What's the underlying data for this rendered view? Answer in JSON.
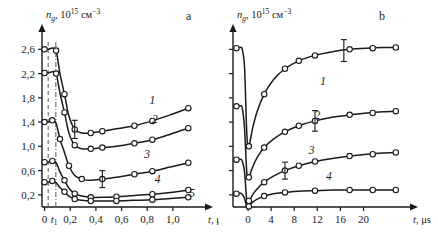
{
  "figure": {
    "background": "#ffffff",
    "ink_color": "#1a1a1a",
    "guide_color": "#555555"
  },
  "chart_data": [
    {
      "type": "line",
      "panel": "a",
      "panel_label": "a",
      "title": "",
      "ylabel": "n_g, 10^15 см^-3",
      "ylabel_symbol": "n",
      "ylabel_subscript": "g",
      "ylabel_rest": ", 10",
      "ylabel_exp1": "15",
      "ylabel_unit": "см",
      "ylabel_exp2": "−3",
      "xlabel": "t, μs",
      "xlabel_symbol": "t",
      "xlabel_unit": ", μs",
      "xticks": [
        0,
        0.2,
        0.4,
        0.6,
        0.8,
        1.0
      ],
      "xticklabels": [
        "0",
        "0,2",
        "0,4",
        "0,6",
        "0,8",
        "1,0"
      ],
      "special_xtick": {
        "label": "t₁",
        "value": 0.075
      },
      "xlim": [
        -0.02,
        1.18
      ],
      "yticks": [
        0.2,
        0.6,
        1.0,
        1.4,
        1.8,
        2.2,
        2.6
      ],
      "yticklabels": [
        "0,2",
        "0,6",
        "1,0",
        "1,4",
        "1,8",
        "2,2",
        "2,6"
      ],
      "ylim": [
        0.0,
        2.82
      ],
      "grid": false,
      "legend": "inline-curve-numbers",
      "guides": [
        {
          "kind": "dashed",
          "x": 0.028
        },
        {
          "kind": "dashdot",
          "x": 0.088
        }
      ],
      "series": [
        {
          "name": "1",
          "label": "1",
          "label_pos": {
            "x": 0.84,
            "y": 1.7
          },
          "x": [
            0.0,
            0.03,
            0.06,
            0.09,
            0.12,
            0.155,
            0.19,
            0.235,
            0.29,
            0.36,
            0.45,
            0.56,
            0.7,
            0.84,
            0.98,
            1.12
          ],
          "y": [
            2.6,
            2.6,
            2.62,
            2.58,
            2.2,
            1.86,
            1.5,
            1.28,
            1.22,
            1.22,
            1.25,
            1.29,
            1.34,
            1.42,
            1.52,
            1.63
          ],
          "markers_x": [
            0.0,
            0.09,
            0.155,
            0.235,
            0.36,
            0.45,
            0.7,
            0.84,
            1.12
          ],
          "markers_y": [
            2.6,
            2.58,
            1.86,
            1.28,
            1.22,
            1.25,
            1.34,
            1.42,
            1.63
          ],
          "errorbars": [
            {
              "x": 0.235,
              "y": 1.28,
              "err": 0.15
            }
          ]
        },
        {
          "name": "2",
          "label": "2",
          "label_pos": {
            "x": 0.86,
            "y": 1.38
          },
          "x": [
            0.0,
            0.03,
            0.06,
            0.09,
            0.12,
            0.155,
            0.19,
            0.235,
            0.29,
            0.36,
            0.45,
            0.56,
            0.7,
            0.84,
            0.98,
            1.12
          ],
          "y": [
            2.21,
            2.21,
            2.23,
            2.2,
            1.88,
            1.56,
            1.22,
            1.02,
            0.96,
            0.96,
            0.98,
            1.0,
            1.05,
            1.11,
            1.2,
            1.3
          ],
          "markers_x": [
            0.0,
            0.09,
            0.155,
            0.235,
            0.36,
            0.45,
            0.7,
            0.84,
            1.12
          ],
          "markers_y": [
            2.21,
            2.2,
            1.56,
            1.02,
            0.96,
            0.98,
            1.05,
            1.11,
            1.3
          ],
          "errorbars": []
        },
        {
          "name": "3",
          "label": "3",
          "label_pos": {
            "x": 0.8,
            "y": 0.8
          },
          "x": [
            0.0,
            0.03,
            0.06,
            0.09,
            0.12,
            0.155,
            0.19,
            0.235,
            0.29,
            0.36,
            0.45,
            0.56,
            0.7,
            0.84,
            0.98,
            1.12
          ],
          "y": [
            1.4,
            1.4,
            1.43,
            1.38,
            1.12,
            0.9,
            0.68,
            0.52,
            0.46,
            0.44,
            0.46,
            0.49,
            0.54,
            0.59,
            0.66,
            0.73
          ],
          "markers_x": [
            0.0,
            0.06,
            0.12,
            0.19,
            0.29,
            0.45,
            0.7,
            0.84,
            1.12
          ],
          "markers_y": [
            1.4,
            1.43,
            1.12,
            0.68,
            0.46,
            0.46,
            0.54,
            0.59,
            0.73
          ],
          "errorbars": [
            {
              "x": 0.45,
              "y": 0.46,
              "err": 0.14
            }
          ]
        },
        {
          "name": "4",
          "label": "4",
          "label_pos": {
            "x": 0.88,
            "y": 0.4
          },
          "x": [
            0.0,
            0.03,
            0.06,
            0.09,
            0.12,
            0.155,
            0.19,
            0.235,
            0.29,
            0.36,
            0.45,
            0.56,
            0.7,
            0.84,
            0.98,
            1.12
          ],
          "y": [
            0.74,
            0.74,
            0.76,
            0.73,
            0.58,
            0.44,
            0.31,
            0.22,
            0.18,
            0.16,
            0.16,
            0.17,
            0.19,
            0.21,
            0.24,
            0.28
          ],
          "markers_x": [
            0.0,
            0.06,
            0.155,
            0.235,
            0.36,
            0.56,
            0.84,
            1.12
          ],
          "markers_y": [
            0.74,
            0.76,
            0.44,
            0.22,
            0.16,
            0.17,
            0.21,
            0.28
          ],
          "errorbars": []
        },
        {
          "name": "5",
          "label": "5",
          "label_pos": {
            "x": 1.15,
            "y": 0.16
          },
          "x": [
            0.0,
            0.03,
            0.06,
            0.09,
            0.12,
            0.155,
            0.19,
            0.235,
            0.29,
            0.36,
            0.45,
            0.56,
            0.7,
            0.84,
            0.98,
            1.12
          ],
          "y": [
            0.41,
            0.41,
            0.43,
            0.4,
            0.32,
            0.25,
            0.18,
            0.13,
            0.11,
            0.1,
            0.1,
            0.1,
            0.11,
            0.12,
            0.14,
            0.16
          ],
          "markers_x": [
            0.0,
            0.06,
            0.155,
            0.235,
            0.36,
            0.56,
            0.84,
            1.12
          ],
          "markers_y": [
            0.41,
            0.43,
            0.25,
            0.13,
            0.1,
            0.1,
            0.12,
            0.16
          ],
          "errorbars": []
        }
      ]
    },
    {
      "type": "line",
      "panel": "b",
      "panel_label": "b",
      "title": "",
      "ylabel": "n_g, 10^15 см^-3",
      "ylabel_symbol": "n",
      "ylabel_subscript": "g",
      "ylabel_rest": ", 10",
      "ylabel_exp1": "15",
      "ylabel_unit": "см",
      "ylabel_exp2": "−3",
      "xlabel": "t, μs",
      "xlabel_symbol": "t",
      "xlabel_unit": ", μs",
      "xticks": [
        0,
        4,
        8,
        12,
        16,
        20
      ],
      "xticklabels": [
        "0",
        "4",
        "8",
        "12",
        "16",
        "20"
      ],
      "xlim": [
        -2.6,
        26.5
      ],
      "yticks_unlabeled": [
        0.2,
        0.6,
        1.0,
        1.4,
        1.8,
        2.2,
        2.6
      ],
      "yticklabels": [],
      "ylim": [
        0.0,
        2.82
      ],
      "grid": false,
      "legend": "inline-curve-numbers",
      "series": [
        {
          "name": "1",
          "label": "1",
          "label_pos": {
            "x": 13.0,
            "y": 2.02
          },
          "x": [
            -2.4,
            -1.9,
            -1.4,
            -1.0,
            -0.6,
            -0.25,
            0.0,
            0.3,
            0.8,
            1.6,
            2.8,
            4.4,
            6.4,
            8.8,
            11.6,
            14.6,
            17.6,
            20.6,
            23.4,
            25.8
          ],
          "y": [
            2.62,
            2.62,
            2.63,
            2.6,
            2.3,
            1.3,
            0.98,
            1.05,
            1.3,
            1.58,
            1.86,
            2.1,
            2.28,
            2.41,
            2.5,
            2.56,
            2.6,
            2.62,
            2.63,
            2.63
          ],
          "markers_x": [
            -2.0,
            0.15,
            2.8,
            6.4,
            8.8,
            11.6,
            17.6,
            21.6,
            25.6
          ],
          "markers_y": [
            2.62,
            1.0,
            1.86,
            2.28,
            2.41,
            2.5,
            2.6,
            2.62,
            2.63
          ],
          "errorbars": [
            {
              "x": 16.6,
              "y": 2.58,
              "err": 0.18
            }
          ]
        },
        {
          "name": "2",
          "label": "2",
          "label_pos": {
            "x": 12.0,
            "y": 1.45
          },
          "x": [
            -2.4,
            -1.9,
            -1.4,
            -1.0,
            -0.6,
            -0.25,
            0.0,
            0.3,
            0.8,
            1.6,
            2.8,
            4.4,
            6.4,
            8.8,
            11.6,
            14.6,
            17.6,
            20.6,
            23.4,
            25.8
          ],
          "y": [
            1.66,
            1.66,
            1.67,
            1.63,
            1.3,
            0.62,
            0.47,
            0.52,
            0.66,
            0.82,
            0.98,
            1.12,
            1.24,
            1.34,
            1.42,
            1.48,
            1.52,
            1.55,
            1.57,
            1.58
          ],
          "markers_x": [
            -2.0,
            0.15,
            2.8,
            6.4,
            8.8,
            11.6,
            17.6,
            21.6,
            25.6
          ],
          "markers_y": [
            1.66,
            0.49,
            0.98,
            1.24,
            1.34,
            1.42,
            1.52,
            1.55,
            1.58
          ],
          "errorbars": [
            {
              "x": 11.6,
              "y": 1.42,
              "err": 0.17
            }
          ]
        },
        {
          "name": "3",
          "label": "3",
          "label_pos": {
            "x": 11.0,
            "y": 0.88
          },
          "x": [
            -2.4,
            -1.9,
            -1.4,
            -1.0,
            -0.6,
            -0.25,
            0.0,
            0.3,
            0.8,
            1.6,
            2.8,
            4.4,
            6.4,
            8.8,
            11.6,
            14.6,
            17.6,
            20.6,
            23.4,
            25.8
          ],
          "y": [
            0.78,
            0.78,
            0.79,
            0.76,
            0.58,
            0.14,
            0.09,
            0.12,
            0.2,
            0.3,
            0.41,
            0.51,
            0.6,
            0.68,
            0.75,
            0.8,
            0.84,
            0.87,
            0.89,
            0.9
          ],
          "markers_x": [
            -2.0,
            0.15,
            2.8,
            6.4,
            8.8,
            11.6,
            17.6,
            21.6,
            25.6
          ],
          "markers_y": [
            0.78,
            0.1,
            0.41,
            0.6,
            0.68,
            0.75,
            0.84,
            0.87,
            0.9
          ],
          "errorbars": [
            {
              "x": 6.4,
              "y": 0.6,
              "err": 0.14
            }
          ]
        },
        {
          "name": "4",
          "label": "4",
          "label_pos": {
            "x": 14.0,
            "y": 0.44
          },
          "x": [
            -2.4,
            -1.9,
            -1.4,
            -1.0,
            -0.6,
            -0.25,
            0.0,
            0.3,
            0.8,
            1.6,
            2.8,
            4.4,
            6.4,
            8.8,
            11.6,
            14.6,
            17.6,
            20.6,
            23.4,
            25.8
          ],
          "y": [
            0.22,
            0.22,
            0.23,
            0.21,
            0.14,
            0.01,
            0.0,
            0.03,
            0.08,
            0.13,
            0.18,
            0.22,
            0.24,
            0.26,
            0.27,
            0.28,
            0.28,
            0.28,
            0.28,
            0.28
          ],
          "markers_x": [
            -2.0,
            0.15,
            2.8,
            6.4,
            11.6,
            17.6,
            21.6,
            25.6
          ],
          "markers_y": [
            0.22,
            0.01,
            0.18,
            0.24,
            0.27,
            0.28,
            0.28,
            0.28
          ],
          "errorbars": []
        }
      ]
    }
  ]
}
